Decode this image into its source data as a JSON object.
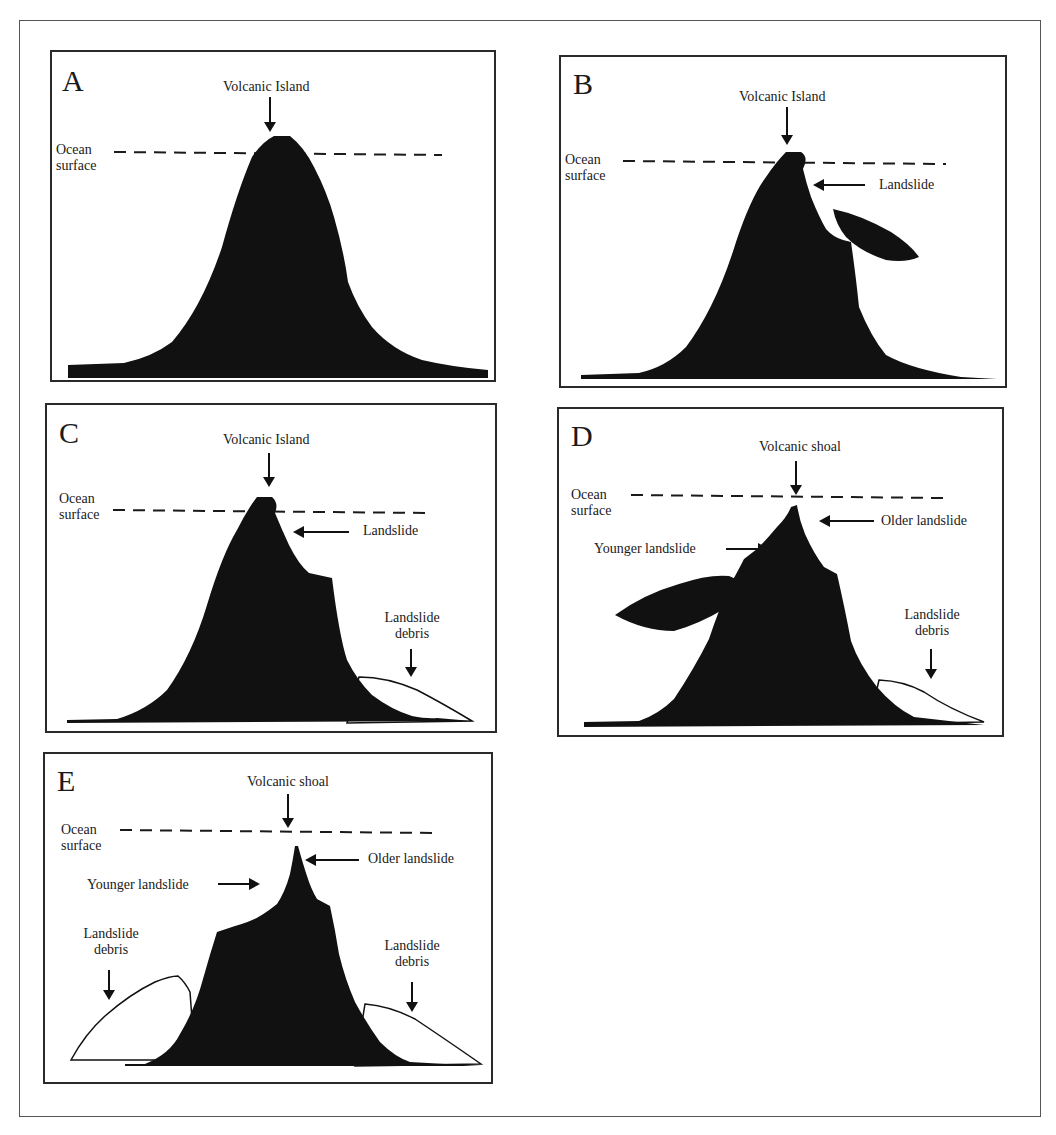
{
  "figure": {
    "panels": [
      {
        "id": "A",
        "letter": "A",
        "title": "Volcanic Island",
        "ocean_label_line1": "Ocean",
        "ocean_label_line2": "surface",
        "stage": "intact volcanic island above ocean surface"
      },
      {
        "id": "B",
        "letter": "B",
        "title": "Volcanic Island",
        "ocean_label_line1": "Ocean",
        "ocean_label_line2": "surface",
        "landslide_label": "Landslide",
        "stage": "flank collapse begins"
      },
      {
        "id": "C",
        "letter": "C",
        "title": "Volcanic Island",
        "ocean_label_line1": "Ocean",
        "ocean_label_line2": "surface",
        "landslide_label": "Landslide",
        "debris_label_line1": "Landslide",
        "debris_label_line2": "debris",
        "stage": "landslide debris deposited on right flank"
      },
      {
        "id": "D",
        "letter": "D",
        "title": "Volcanic shoal",
        "ocean_label_line1": "Ocean",
        "ocean_label_line2": "surface",
        "older_landslide_label": "Older landslide",
        "younger_landslide_label": "Younger landslide",
        "debris_label_line1": "Landslide",
        "debris_label_line2": "debris",
        "stage": "summit below ocean surface; second landslide on left flank"
      },
      {
        "id": "E",
        "letter": "E",
        "title": "Volcanic shoal",
        "ocean_label_line1": "Ocean",
        "ocean_label_line2": "surface",
        "older_landslide_label": "Older landslide",
        "younger_landslide_label": "Younger landslide",
        "debris_left_line1": "Landslide",
        "debris_left_line2": "debris",
        "debris_right_line1": "Landslide",
        "debris_right_line2": "debris",
        "stage": "debris on both flanks; volcanic shoal remains"
      }
    ],
    "colors": {
      "volcano_fill": "#111111",
      "debris_fill": "#ffffff",
      "frame": "#2a2a2a",
      "ocean_line": "#1a1a1a"
    }
  }
}
